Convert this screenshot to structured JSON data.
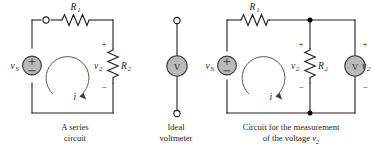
{
  "figure": {
    "background_color": "#ffffff",
    "line_color": "#231f20",
    "component_fill_color": "#b9b9b9",
    "loop_arrow_color": "#5a5a5a"
  },
  "panels": [
    {
      "id": "series-circuit",
      "caption_line1": "A series",
      "caption_line2": "circuit",
      "labels": {
        "source": "v",
        "source_sub": "S",
        "resistor1": "R",
        "resistor1_sub": "1",
        "resistor2": "R",
        "resistor2_sub": "2",
        "voltage2": "v",
        "voltage2_sub": "2",
        "current": "i",
        "plus": "+",
        "minus": "−"
      },
      "components": [
        "voltage-source",
        "resistor-r1",
        "resistor-r2",
        "open-terminal",
        "current-loop-arrow"
      ]
    },
    {
      "id": "ideal-voltmeter",
      "caption_line1": "Ideal",
      "caption_line2": "voltmeter",
      "labels": {
        "meter": "V"
      },
      "components": [
        "voltmeter-symbol",
        "terminal-top",
        "terminal-bottom"
      ]
    },
    {
      "id": "voltage-measurement-circuit",
      "caption_line1": "Circuit for the measurement",
      "caption_line2_prefix": "of the voltage ",
      "caption_line2_var": "v",
      "caption_line2_sub": "2",
      "labels": {
        "source": "v",
        "source_sub": "S",
        "resistor1": "R",
        "resistor1_sub": "1",
        "resistor2": "R",
        "resistor2_sub": "2",
        "voltage2_resistor": "v",
        "voltage2_resistor_sub": "2",
        "voltage2_meter": "v",
        "voltage2_meter_sub": "2",
        "current": "i",
        "meter": "V",
        "plus": "+",
        "minus": "−"
      },
      "components": [
        "voltage-source",
        "resistor-r1",
        "resistor-r2",
        "voltmeter-symbol",
        "node-dot-top",
        "node-dot-bottom",
        "current-loop-arrow"
      ]
    }
  ]
}
